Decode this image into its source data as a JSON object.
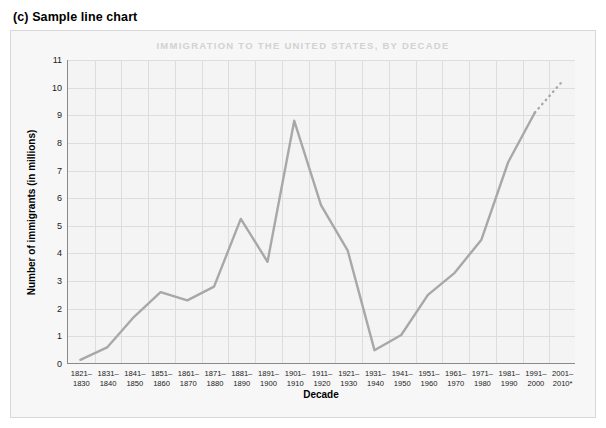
{
  "figure": {
    "caption": "(c) Sample line chart"
  },
  "footnote": "*Projection based on 2001–2002 data",
  "colors": {
    "line": "#a8a8a8",
    "grid": "#dddddd",
    "axis": "#8a8a8a",
    "title": "#d2d2d2",
    "plot_background": "#f4f4f4",
    "card_background": "#f7f7f7",
    "text": "#1a1a1a"
  },
  "chart_data": {
    "type": "line",
    "title": "IMMIGRATION TO THE UNITED STATES, BY DECADE",
    "xlabel": "Decade",
    "ylabel": "Number of immigrants (in millions)",
    "ylim": [
      0,
      11
    ],
    "ytick_labels": [
      "0",
      "1",
      "2",
      "3",
      "4",
      "5",
      "6",
      "7",
      "8",
      "9",
      "10",
      "11"
    ],
    "yticks": [
      0,
      1,
      2,
      3,
      4,
      5,
      6,
      7,
      8,
      9,
      10,
      11
    ],
    "grid": true,
    "legend": null,
    "categories": [
      "1821–\n1830",
      "1831–\n1840",
      "1841–\n1850",
      "1851–\n1860",
      "1861–\n1870",
      "1871–\n1880",
      "1881–\n1890",
      "1891–\n1900",
      "1901–\n1910",
      "1911–\n1920",
      "1921–\n1930",
      "1931–\n1940",
      "1941–\n1950",
      "1951–\n1960",
      "1961–\n1970",
      "1971–\n1980",
      "1981–\n1990",
      "1991–\n2000",
      "2001–\n2010*"
    ],
    "values": [
      0.15,
      0.6,
      1.7,
      2.6,
      2.3,
      2.8,
      5.25,
      3.7,
      8.8,
      5.75,
      4.1,
      0.5,
      1.05,
      2.5,
      3.3,
      4.5,
      7.3,
      9.1,
      10.2
    ],
    "projection": {
      "from_index": 17,
      "to_index": 18,
      "style": "dotted",
      "note": "*Projection based on 2001–2002 data"
    }
  }
}
